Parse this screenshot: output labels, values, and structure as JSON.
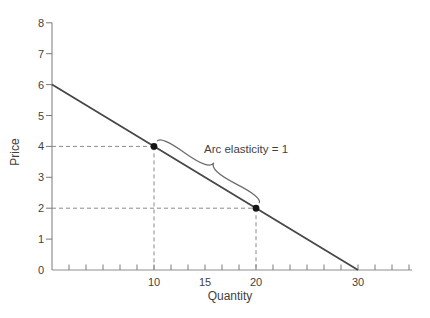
{
  "figure": {
    "background": "#ffffff"
  },
  "chart_data": {
    "type": "line",
    "title": "",
    "xlabel": "Quantity",
    "ylabel": "Price",
    "annotation": "Arc elasticity = 1",
    "xlim": [
      0,
      35.3
    ],
    "ylim": [
      0,
      8
    ],
    "grid": false,
    "legend": "none",
    "x_axis_tick_values": [
      10,
      15,
      20,
      30
    ],
    "x_axis_tick_labels": [
      "10",
      "15",
      "20",
      "30"
    ],
    "x_minor_tick_step": 1.6667,
    "y_axis_tick_values": [
      0,
      1,
      2,
      3,
      4,
      5,
      6,
      7,
      8
    ],
    "series": [
      {
        "name": "demand-line",
        "x": [
          0,
          30
        ],
        "y": [
          6,
          0
        ]
      }
    ],
    "marked_points": [
      {
        "x": 10,
        "y": 4
      },
      {
        "x": 20,
        "y": 2
      }
    ],
    "guides_style": "dashed",
    "brace": {
      "offset": 6,
      "width": 11,
      "curviness": 0.6
    },
    "colors": {
      "line": "#474747",
      "axis": "#8f8f8f",
      "tick": "#7a7a7a",
      "label": "#3f3f3f",
      "guide": "#8a8a8a",
      "point": "#151515",
      "brace": "#6b6b6b"
    }
  }
}
